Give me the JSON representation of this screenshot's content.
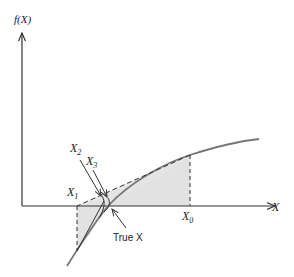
{
  "diagram": {
    "labels": {
      "y_axis": "f(X)",
      "x_axis": "X",
      "x0": "X",
      "x0_sub": "0",
      "x1": "X",
      "x1_sub": "1",
      "x2": "X",
      "x2_sub": "2",
      "x3": "X",
      "x3_sub": "3",
      "true_x": "True X"
    },
    "colors": {
      "axis": "#333333",
      "curve": "#777777",
      "shade": "#e2e2e2",
      "dashed": "#333333"
    }
  }
}
